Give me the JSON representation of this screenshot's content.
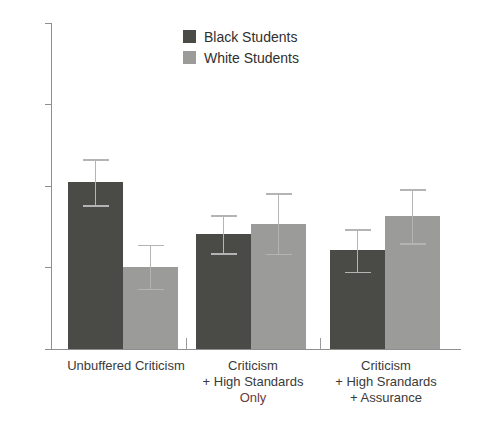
{
  "chart_data": {
    "type": "bar",
    "title": "",
    "subtitle": "",
    "xlabel": "",
    "ylabel": "",
    "ylim": [
      1,
      5
    ],
    "yticks": [
      1,
      2,
      3,
      4,
      5
    ],
    "ytick_labels": [
      "1",
      "2",
      "3",
      "4",
      "5"
    ],
    "grid": false,
    "legend_position": "top-center",
    "categories": [
      "Unbuffered Criticism",
      "Criticism\n+ High Standards\nOnly",
      "Criticism\n+ High Srandards\n+ Assurance"
    ],
    "series": [
      {
        "name": "Black Students",
        "color": "#4a4a47",
        "values": [
          3.05,
          2.41,
          2.21
        ],
        "errors": [
          0.28,
          0.23,
          0.26
        ],
        "error_upper": [
          3.33,
          2.64,
          2.47
        ],
        "error_lower": [
          2.77,
          2.18,
          1.95
        ]
      },
      {
        "name": "White Students",
        "color": "#9b9b99",
        "values": [
          2.01,
          2.54,
          2.63
        ],
        "errors": [
          0.27,
          0.37,
          0.33
        ],
        "error_upper": [
          2.28,
          2.91,
          2.96
        ],
        "error_lower": [
          1.74,
          2.17,
          2.3
        ]
      }
    ]
  },
  "legend": {
    "items": [
      {
        "label": "Black Students",
        "color": "#4a4a47"
      },
      {
        "label": "White Students",
        "color": "#9b9b99"
      }
    ]
  },
  "axis": {
    "y_tick_labels": [
      "5",
      "4",
      "3",
      "2",
      "1"
    ]
  },
  "categories": [
    {
      "line1": "Unbuffered Criticism",
      "line2": "",
      "line3": ""
    },
    {
      "line1": "Criticism",
      "line2": "+ High Standards",
      "line3": "Only"
    },
    {
      "line1": "Criticism",
      "line2": "+ High Srandards",
      "line3": "+ Assurance"
    }
  ]
}
